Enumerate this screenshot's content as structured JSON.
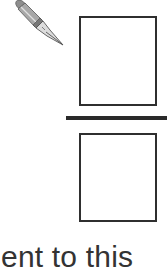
{
  "illustration": {
    "icon": "fountain-pen-icon",
    "colors": {
      "box_border": "#2f2f2f",
      "divider": "#2a2a2a",
      "text": "#333333",
      "pen_body": "#9a9a9a",
      "pen_nib": "#d8d8d8"
    }
  },
  "fraction": {
    "numerator_box": "",
    "denominator_box": ""
  },
  "caption": {
    "text": "ent to this"
  }
}
